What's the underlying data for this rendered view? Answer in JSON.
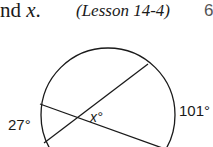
{
  "header": {
    "instruction_prefix": "nd ",
    "variable": "x",
    "instruction_suffix": ".",
    "lesson_ref": "(Lesson 14-4)",
    "problem_marker": "6"
  },
  "figure": {
    "type": "circle-with-intersecting-chords",
    "arc_left_label": "27°",
    "arc_right_label": "101°",
    "angle_label": "x°",
    "colors": {
      "stroke": "#1a1a1a",
      "background": "#ffffff"
    }
  }
}
